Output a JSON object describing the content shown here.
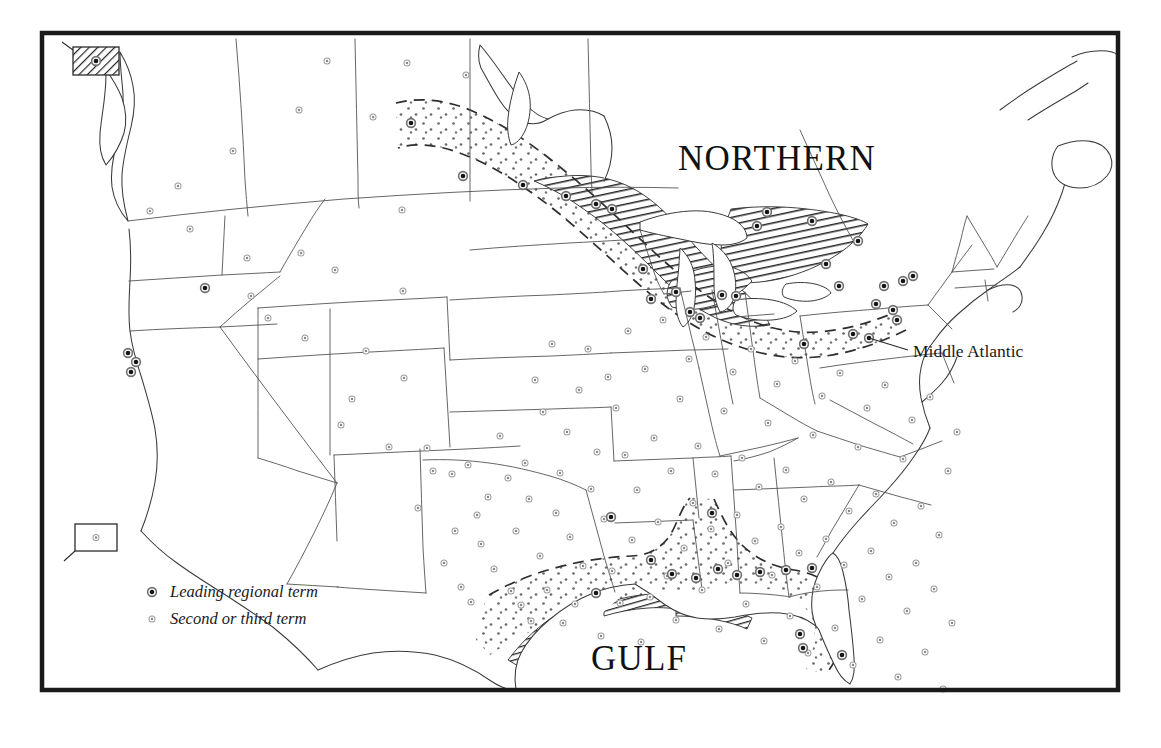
{
  "figure": {
    "kind": "thematic-dialect-map",
    "area": "United States and southern Canada",
    "frame": {
      "x": 42,
      "y": 33,
      "width": 1076,
      "height": 657
    },
    "background_color": "#ffffff",
    "ink_color": "#1a1a1a"
  },
  "region_labels": [
    {
      "id": "northern",
      "text": "NORTHERN",
      "x": 678,
      "y": 170,
      "size": 35
    },
    {
      "id": "gulf",
      "text": "GULF",
      "x": 591,
      "y": 670,
      "size": 35
    }
  ],
  "callouts": [
    {
      "id": "middle-atlantic",
      "text": "Middle Atlantic",
      "x": 913,
      "y": 357,
      "leader": "M 908 350 L 869 338"
    }
  ],
  "legend": {
    "x": 152,
    "y": 597,
    "items": [
      {
        "id": "leading",
        "symbol": "leading-term-dot",
        "label": "Leading regional term"
      },
      {
        "id": "second",
        "symbol": "second-third-term-dot",
        "label": "Second or third term"
      }
    ]
  },
  "insets": [
    {
      "id": "alaska-inset",
      "name": "alaska",
      "x": 73,
      "y": 47,
      "width": 46,
      "height": 28,
      "shading": "hatched",
      "marker": "leading-term-dot",
      "leader": "M 73 50 L 62 42"
    },
    {
      "id": "hawaii-inset",
      "name": "hawaii",
      "x": 75,
      "y": 524,
      "width": 42,
      "height": 27,
      "shading": "plain",
      "marker": "second-third-term-dot",
      "leader": "M 75 551 L 64 561"
    }
  ],
  "zones": [
    {
      "id": "northern-core",
      "label": "NORTHERN",
      "pattern": "diagonal-hatch",
      "meaning": "core area of the Northern dialect region"
    },
    {
      "id": "northern-transition",
      "label": "NORTHERN",
      "pattern": "stipple",
      "boundary": "dashed",
      "meaning": "outer transition band of the Northern dialect region"
    },
    {
      "id": "gulf-core",
      "label": "GULF",
      "pattern": "diagonal-hatch",
      "meaning": "core coastal area of the Gulf dialect region"
    },
    {
      "id": "gulf-transition",
      "label": "GULF",
      "pattern": "stipple",
      "boundary": "dashed",
      "meaning": "outer transition band of the Gulf dialect region"
    }
  ],
  "symbol_counts": {
    "leading_regional_term": 46,
    "second_or_third_term": 139
  },
  "leading_term_points": [
    [
      411,
      123
    ],
    [
      463,
      176
    ],
    [
      523,
      185
    ],
    [
      566,
      196
    ],
    [
      596,
      204
    ],
    [
      612,
      209
    ],
    [
      643,
      269
    ],
    [
      651,
      299
    ],
    [
      676,
      292
    ],
    [
      690,
      312
    ],
    [
      700,
      318
    ],
    [
      722,
      295
    ],
    [
      736,
      296
    ],
    [
      757,
      226
    ],
    [
      767,
      212
    ],
    [
      804,
      344
    ],
    [
      812,
      221
    ],
    [
      826,
      264
    ],
    [
      839,
      286
    ],
    [
      853,
      334
    ],
    [
      858,
      241
    ],
    [
      869,
      338
    ],
    [
      876,
      304
    ],
    [
      884,
      286
    ],
    [
      893,
      310
    ],
    [
      897,
      320
    ],
    [
      903,
      281
    ],
    [
      913,
      276
    ],
    [
      205,
      288
    ],
    [
      128,
      353
    ],
    [
      136,
      362
    ],
    [
      131,
      372
    ],
    [
      611,
      517
    ],
    [
      651,
      560
    ],
    [
      672,
      574
    ],
    [
      696,
      578
    ],
    [
      712,
      513
    ],
    [
      718,
      569
    ],
    [
      737,
      575
    ],
    [
      760,
      572
    ],
    [
      786,
      570
    ],
    [
      800,
      634
    ],
    [
      803,
      648
    ],
    [
      812,
      568
    ],
    [
      842,
      655
    ],
    [
      596,
      593
    ]
  ],
  "second_term_points": [
    [
      327,
      61
    ],
    [
      299,
      110
    ],
    [
      407,
      63
    ],
    [
      466,
      75
    ],
    [
      150,
      211
    ],
    [
      178,
      186
    ],
    [
      190,
      229
    ],
    [
      233,
      151
    ],
    [
      247,
      258
    ],
    [
      251,
      296
    ],
    [
      268,
      318
    ],
    [
      301,
      253
    ],
    [
      305,
      338
    ],
    [
      335,
      270
    ],
    [
      341,
      425
    ],
    [
      352,
      399
    ],
    [
      366,
      351
    ],
    [
      373,
      117
    ],
    [
      389,
      447
    ],
    [
      402,
      210
    ],
    [
      403,
      291
    ],
    [
      404,
      378
    ],
    [
      418,
      508
    ],
    [
      427,
      448
    ],
    [
      433,
      471
    ],
    [
      444,
      563
    ],
    [
      452,
      474
    ],
    [
      455,
      531
    ],
    [
      461,
      587
    ],
    [
      468,
      465
    ],
    [
      471,
      602
    ],
    [
      477,
      515
    ],
    [
      481,
      544
    ],
    [
      488,
      497
    ],
    [
      494,
      569
    ],
    [
      500,
      436
    ],
    [
      508,
      478
    ],
    [
      511,
      591
    ],
    [
      516,
      531
    ],
    [
      521,
      605
    ],
    [
      525,
      463
    ],
    [
      529,
      499
    ],
    [
      531,
      621
    ],
    [
      535,
      380
    ],
    [
      540,
      556
    ],
    [
      543,
      412
    ],
    [
      547,
      590
    ],
    [
      552,
      344
    ],
    [
      556,
      513
    ],
    [
      560,
      473
    ],
    [
      563,
      623
    ],
    [
      567,
      432
    ],
    [
      570,
      537
    ],
    [
      575,
      604
    ],
    [
      579,
      390
    ],
    [
      583,
      566
    ],
    [
      588,
      349
    ],
    [
      591,
      489
    ],
    [
      597,
      452
    ],
    [
      601,
      636
    ],
    [
      604,
      519
    ],
    [
      608,
      377
    ],
    [
      612,
      571
    ],
    [
      616,
      408
    ],
    [
      620,
      603
    ],
    [
      625,
      455
    ],
    [
      628,
      331
    ],
    [
      632,
      540
    ],
    [
      637,
      490
    ],
    [
      641,
      642
    ],
    [
      645,
      369
    ],
    [
      650,
      597
    ],
    [
      654,
      438
    ],
    [
      658,
      522
    ],
    [
      663,
      320
    ],
    [
      667,
      576
    ],
    [
      671,
      471
    ],
    [
      676,
      620
    ],
    [
      680,
      399
    ],
    [
      684,
      548
    ],
    [
      689,
      359
    ],
    [
      693,
      503
    ],
    [
      698,
      446
    ],
    [
      702,
      590
    ],
    [
      706,
      337
    ],
    [
      711,
      529
    ],
    [
      715,
      474
    ],
    [
      719,
      629
    ],
    [
      724,
      411
    ],
    [
      728,
      563
    ],
    [
      733,
      372
    ],
    [
      737,
      515
    ],
    [
      742,
      458
    ],
    [
      746,
      604
    ],
    [
      751,
      349
    ],
    [
      755,
      541
    ],
    [
      759,
      487
    ],
    [
      764,
      641
    ],
    [
      768,
      423
    ],
    [
      772,
      575
    ],
    [
      777,
      384
    ],
    [
      781,
      527
    ],
    [
      786,
      470
    ],
    [
      790,
      616
    ],
    [
      795,
      361
    ],
    [
      799,
      553
    ],
    [
      804,
      499
    ],
    [
      808,
      653
    ],
    [
      813,
      435
    ],
    [
      817,
      587
    ],
    [
      822,
      396
    ],
    [
      826,
      539
    ],
    [
      831,
      482
    ],
    [
      835,
      628
    ],
    [
      840,
      373
    ],
    [
      844,
      565
    ],
    [
      849,
      511
    ],
    [
      853,
      665
    ],
    [
      858,
      447
    ],
    [
      862,
      599
    ],
    [
      867,
      408
    ],
    [
      871,
      551
    ],
    [
      876,
      494
    ],
    [
      880,
      640
    ],
    [
      885,
      385
    ],
    [
      889,
      577
    ],
    [
      894,
      523
    ],
    [
      898,
      677
    ],
    [
      903,
      459
    ],
    [
      907,
      611
    ],
    [
      912,
      420
    ],
    [
      916,
      563
    ],
    [
      921,
      506
    ],
    [
      925,
      652
    ],
    [
      930,
      397
    ],
    [
      934,
      589
    ],
    [
      939,
      535
    ],
    [
      943,
      689
    ],
    [
      948,
      471
    ],
    [
      952,
      623
    ],
    [
      957,
      432
    ]
  ],
  "colors": {
    "frame": "#1a1a1a",
    "coastline": "#3a3a3a",
    "state_boundary": "#4a4a4a",
    "hatch": "#2b2b2b",
    "stipple": "#6a6a6a",
    "dashed_boundary": "#2e2e2e",
    "leading_dot": "#151515",
    "second_dot": "#8a8a8a",
    "text": "#111111"
  }
}
